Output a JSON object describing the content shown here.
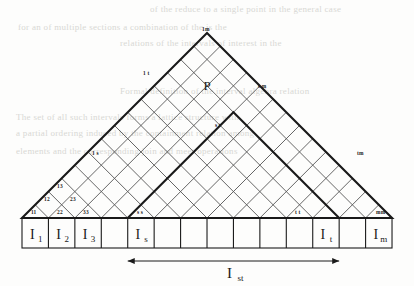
{
  "figure": {
    "title_label": "P",
    "apex_label": "1m",
    "grid": {
      "columns": 14,
      "base_y": 218,
      "apex": [
        207,
        22
      ],
      "cell_width": 26.43
    },
    "diagonal_labels": {
      "row1": [
        "11",
        "12",
        "13"
      ],
      "row2": [
        "22",
        "23"
      ],
      "row3": [
        "33"
      ],
      "left_edge": [
        "1 s",
        "1 t",
        "1m"
      ],
      "interior": [
        "s s",
        "s t",
        "s m"
      ],
      "right_lower": [
        "t t",
        "tm",
        "mm"
      ]
    },
    "small_labels": [
      {
        "text": "11",
        "x": 31,
        "y": 214
      },
      {
        "text": "12",
        "x": 44,
        "y": 201
      },
      {
        "text": "13",
        "x": 57,
        "y": 188
      },
      {
        "text": "22",
        "x": 57,
        "y": 214
      },
      {
        "text": "23",
        "x": 70,
        "y": 201
      },
      {
        "text": "33",
        "x": 83,
        "y": 214
      },
      {
        "text": "1 s",
        "x": 92,
        "y": 155
      },
      {
        "text": "s s",
        "x": 137,
        "y": 214
      },
      {
        "text": "1 t",
        "x": 143,
        "y": 75
      },
      {
        "text": "s t",
        "x": 215,
        "y": 127
      },
      {
        "text": "t t",
        "x": 295,
        "y": 214
      },
      {
        "text": "1m",
        "x": 202,
        "y": 31
      },
      {
        "text": "s m",
        "x": 258,
        "y": 88
      },
      {
        "text": "tm",
        "x": 357,
        "y": 155
      },
      {
        "text": "mm",
        "x": 376,
        "y": 214
      }
    ],
    "boxes": [
      {
        "index": 1,
        "label": "I",
        "sub": "1"
      },
      {
        "index": 2,
        "label": "I",
        "sub": "2"
      },
      {
        "index": 3,
        "label": "I",
        "sub": "3"
      },
      {
        "index": 4,
        "label": "",
        "sub": ""
      },
      {
        "index": 5,
        "label": "I",
        "sub": "s"
      },
      {
        "index": 6,
        "label": "",
        "sub": ""
      },
      {
        "index": 7,
        "label": "",
        "sub": ""
      },
      {
        "index": 8,
        "label": "",
        "sub": ""
      },
      {
        "index": 9,
        "label": "",
        "sub": ""
      },
      {
        "index": 10,
        "label": "",
        "sub": ""
      },
      {
        "index": 11,
        "label": "",
        "sub": ""
      },
      {
        "index": 12,
        "label": "I",
        "sub": "t"
      },
      {
        "index": 13,
        "label": "",
        "sub": ""
      },
      {
        "index": 14,
        "label": "I",
        "sub": "m"
      }
    ],
    "box_labels": {
      "b1": "I",
      "b1s": "1",
      "b2": "I",
      "b2s": "2",
      "b3": "I",
      "b3s": "3",
      "b5": "I",
      "b5s": "s",
      "b12": "I",
      "b12s": "t",
      "b14": "I",
      "b14s": "m"
    },
    "measure": {
      "label": "I",
      "sublabel": "st",
      "from_box": 5,
      "to_box": 12
    },
    "colors": {
      "ink": "#1a1a1a",
      "grid": "#555555",
      "ghost_text": "#d8d8d4",
      "paper": "#fdfdfc"
    }
  },
  "ghost_text_lines": [
    {
      "text": "of the  reduce  to  a  single  point  in  the  general  case",
      "x": 150,
      "y": 4
    },
    {
      "text": "for  an     of    multiple  sections  a  combination  of  the      is  the",
      "x": 18,
      "y": 22
    },
    {
      "text": "relations  of  the  intervals  of  interest  in  the",
      "x": 120,
      "y": 38
    },
    {
      "text": "Formal  definition  of  the  interval  algebra  relation",
      "x": 120,
      "y": 86
    },
    {
      "text": "The  set  of  all  such  intervals  forms  a  lattice  structure  with",
      "x": 16,
      "y": 112
    },
    {
      "text": "a  partial  ordering  induced  by  the  containment  relation  among",
      "x": 16,
      "y": 128
    },
    {
      "text": "elements  and  the  corresponding  join  and  meet  operations",
      "x": 16,
      "y": 146
    }
  ]
}
